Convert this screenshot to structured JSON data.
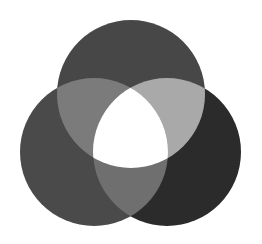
{
  "diagram": {
    "type": "venn-3",
    "background": "#ffffff",
    "circles": [
      {
        "id": "top",
        "cx": 131,
        "cy": 94,
        "r": 74,
        "fill": "#474747"
      },
      {
        "id": "left",
        "cx": 94,
        "cy": 152,
        "r": 74,
        "fill": "#4a4a4a"
      },
      {
        "id": "right",
        "cx": 167,
        "cy": 152,
        "r": 74,
        "fill": "#2b2b2b"
      }
    ],
    "overlaps": {
      "top_left": "#7b7b7b",
      "top_right": "#a9a9a9",
      "left_right": "#6f6f6f",
      "all_three": "#ffffff"
    }
  }
}
